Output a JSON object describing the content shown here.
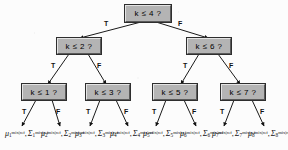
{
  "figure": {
    "kind": "binary-decision-tree",
    "depth": 3,
    "node_fill": "#b4b4b4",
    "background": "#fcfcfc",
    "edge_color": "#1a1a1a"
  },
  "branch_labels": {
    "true": "T",
    "false": "F"
  },
  "nodes": {
    "root": {
      "text": "k ≤ 4 ?",
      "level": 0
    },
    "l1_t": {
      "text": "k ≤ 2 ?",
      "level": 1
    },
    "l1_f": {
      "text": "k ≤ 6 ?",
      "level": 1
    },
    "l2_tt": {
      "text": "k ≤ 1 ?",
      "level": 2
    },
    "l2_tf": {
      "text": "k ≤ 3 ?",
      "level": 2
    },
    "l2_ft": {
      "text": "k ≤ 5 ?",
      "level": 2
    },
    "l2_ff": {
      "text": "k ≤ 7 ?",
      "level": 2
    }
  },
  "branches": [
    {
      "from": "root",
      "label": "T",
      "to": "l1_t"
    },
    {
      "from": "root",
      "label": "F",
      "to": "l1_f"
    },
    {
      "from": "l1_t",
      "label": "T",
      "to": "l2_tt"
    },
    {
      "from": "l1_t",
      "label": "F",
      "to": "l2_tf"
    },
    {
      "from": "l1_f",
      "label": "T",
      "to": "l2_ft"
    },
    {
      "from": "l1_f",
      "label": "F",
      "to": "l2_ff"
    },
    {
      "from": "l2_tt",
      "label": "T",
      "to": "leaf1"
    },
    {
      "from": "l2_tt",
      "label": "F",
      "to": "leaf2"
    },
    {
      "from": "l2_tf",
      "label": "T",
      "to": "leaf3"
    },
    {
      "from": "l2_tf",
      "label": "F",
      "to": "leaf4"
    },
    {
      "from": "l2_ft",
      "label": "T",
      "to": "leaf5"
    },
    {
      "from": "l2_ft",
      "label": "F",
      "to": "leaf6"
    },
    {
      "from": "l2_ff",
      "label": "T",
      "to": "leaf7"
    },
    {
      "from": "l2_ff",
      "label": "F",
      "to": "leaf8"
    }
  ],
  "leaves": [
    {
      "mu": "μ",
      "sigma": "Σ",
      "index": "1",
      "superscript": "mix|ref"
    },
    {
      "mu": "μ",
      "sigma": "Σ",
      "index": "2",
      "superscript": "mix|ref"
    },
    {
      "mu": "μ",
      "sigma": "Σ",
      "index": "3",
      "superscript": "mix|ref"
    },
    {
      "mu": "μ",
      "sigma": "Σ",
      "index": "4",
      "superscript": "mix|ref"
    },
    {
      "mu": "μ",
      "sigma": "Σ",
      "index": "5",
      "superscript": "mix|ref"
    },
    {
      "mu": "μ",
      "sigma": "Σ",
      "index": "6",
      "superscript": "mix|ref"
    },
    {
      "mu": "μ",
      "sigma": "Σ",
      "index": "7",
      "superscript": "mix|ref"
    },
    {
      "mu": "μ",
      "sigma": "Σ",
      "index": "8",
      "superscript": "mix|ref"
    }
  ]
}
